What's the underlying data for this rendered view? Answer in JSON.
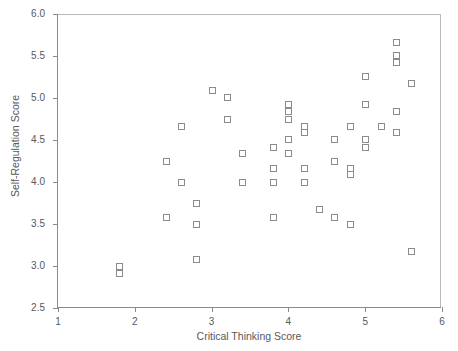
{
  "chart_data": {
    "type": "scatter",
    "title": "",
    "xlabel": "Critical Thinking Score",
    "ylabel": "Self-Regulation Score",
    "xlim": [
      1,
      6
    ],
    "ylim": [
      2.5,
      6.0
    ],
    "xticks": [
      "1",
      "2",
      "3",
      "4",
      "5",
      "6"
    ],
    "yticks": [
      "2.5",
      "3.0",
      "3.5",
      "4.0",
      "4.5",
      "5.0",
      "5.5",
      "6.0"
    ],
    "grid": false,
    "legend": null,
    "marker_style": "open-square",
    "marker_color": "#8b8b8d",
    "series": [
      {
        "name": "observations",
        "points": [
          [
            1.8,
            3.0
          ],
          [
            1.8,
            2.92
          ],
          [
            2.4,
            4.25
          ],
          [
            2.4,
            3.58
          ],
          [
            2.6,
            4.67
          ],
          [
            2.6,
            4.0
          ],
          [
            2.8,
            3.75
          ],
          [
            2.8,
            3.5
          ],
          [
            2.8,
            3.08
          ],
          [
            3.0,
            5.09
          ],
          [
            3.2,
            5.01
          ],
          [
            3.2,
            4.75
          ],
          [
            3.4,
            4.34
          ],
          [
            3.4,
            4.0
          ],
          [
            3.8,
            4.42
          ],
          [
            3.8,
            4.17
          ],
          [
            3.8,
            4.0
          ],
          [
            3.8,
            3.58
          ],
          [
            4.0,
            4.93
          ],
          [
            4.0,
            4.84
          ],
          [
            4.0,
            4.75
          ],
          [
            4.0,
            4.51
          ],
          [
            4.0,
            4.34
          ],
          [
            4.2,
            4.67
          ],
          [
            4.2,
            4.59
          ],
          [
            4.2,
            4.17
          ],
          [
            4.2,
            4.0
          ],
          [
            4.4,
            3.68
          ],
          [
            4.6,
            4.51
          ],
          [
            4.6,
            4.25
          ],
          [
            4.6,
            3.58
          ],
          [
            4.8,
            4.67
          ],
          [
            4.8,
            4.17
          ],
          [
            4.8,
            4.09
          ],
          [
            4.8,
            3.5
          ],
          [
            5.0,
            5.26
          ],
          [
            5.0,
            4.93
          ],
          [
            5.0,
            4.51
          ],
          [
            5.0,
            4.42
          ],
          [
            5.2,
            4.67
          ],
          [
            5.4,
            5.67
          ],
          [
            5.4,
            5.51
          ],
          [
            5.4,
            5.43
          ],
          [
            5.4,
            4.84
          ],
          [
            5.4,
            4.59
          ],
          [
            5.6,
            5.18
          ],
          [
            5.6,
            3.18
          ]
        ]
      }
    ]
  },
  "axes": {
    "x_title": "Critical Thinking Score",
    "y_title": "Self-Regulation Score"
  },
  "caption": {
    "cropped_text": ""
  }
}
